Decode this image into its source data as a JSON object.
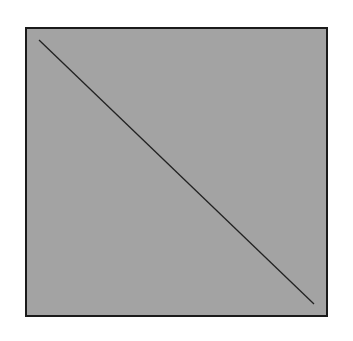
{
  "diagram": {
    "title": "Origami fold step: fold corner to point",
    "paper": {
      "fill": "#a3a3a3",
      "stroke": "#1a1a1a",
      "x": 26,
      "y": 28,
      "width": 301,
      "height": 288
    },
    "crease_lines": [
      {
        "id": "diagonal-a",
        "x1": 39,
        "y1": 40,
        "x2": 314,
        "y2": 304
      },
      {
        "id": "diagonal-b",
        "x1": 314,
        "y1": 40,
        "x2": 39,
        "y2": 304
      }
    ],
    "reference_mark": {
      "x1": 26,
      "y1": 172,
      "x2": 74,
      "y2": 172
    },
    "fold_line": {
      "x1": 26,
      "y1": 172,
      "x2": 325,
      "y2": 316,
      "dash": "14 10"
    },
    "points": [
      {
        "id": "left-edge-point",
        "cx": 26,
        "cy": 172,
        "r": 6
      },
      {
        "id": "bottom-right-corner-point",
        "cx": 326,
        "cy": 317,
        "r": 6
      }
    ],
    "arrow": {
      "path": "M 61 292 Q 120 200 146 112",
      "head": "M 129 136 L 146 110 L 151 144",
      "color": "#111111"
    }
  }
}
